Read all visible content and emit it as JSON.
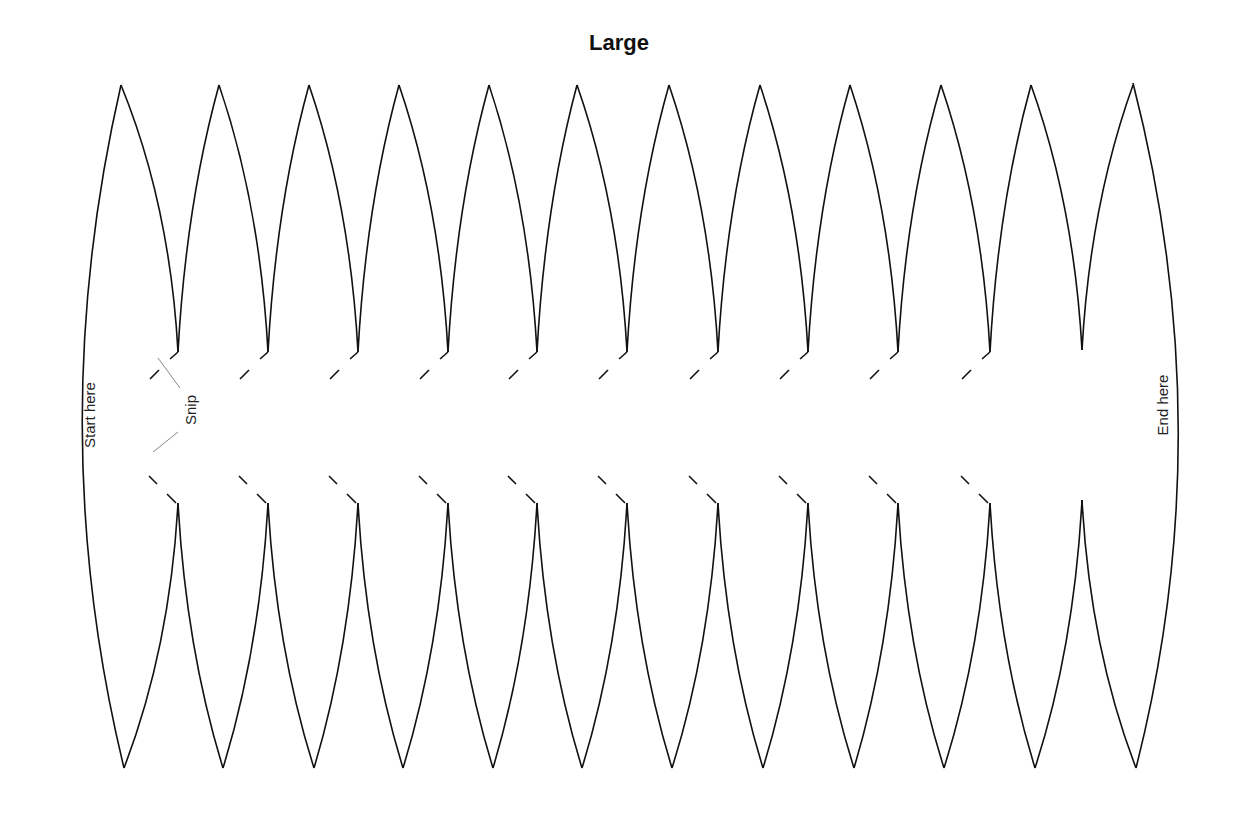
{
  "title": "Large",
  "labels": {
    "start": "Start here",
    "end": "End here",
    "snip": "Snip"
  },
  "diagram": {
    "type": "gore-template",
    "gore_count": 12,
    "stroke_color": "#111111",
    "snip_leader_color": "#888888",
    "top_peaks_x": [
      121,
      219,
      309,
      399,
      489,
      577,
      669,
      760,
      850,
      941,
      1031,
      1133
    ],
    "bottom_peaks_x": [
      124,
      223,
      314,
      403,
      493,
      582,
      672,
      763,
      854,
      944,
      1035,
      1136
    ],
    "inner_cusps_x": [
      178,
      268,
      358,
      448,
      537,
      627,
      718,
      808,
      898,
      990,
      1082
    ],
    "notched_cusps": 10
  }
}
